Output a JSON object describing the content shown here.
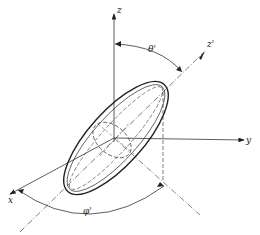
{
  "diagram": {
    "type": "3D coordinate system with rotated ellipsoid",
    "axes": {
      "z": "z",
      "y": "y",
      "x": "x",
      "z_prime": "z'"
    },
    "angles": {
      "theta_prime": "θ'",
      "phi_prime": "φ'"
    },
    "colors": {
      "line": "#222222",
      "background": "#ffffff"
    }
  }
}
